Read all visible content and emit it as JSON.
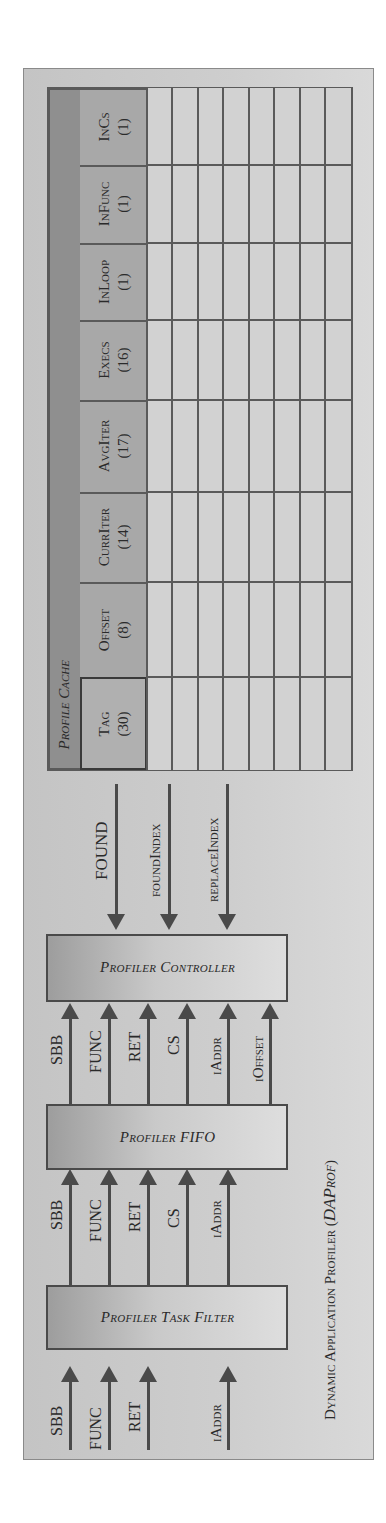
{
  "diagram": {
    "caption": "Dynamic Application Profiler (DAProf)",
    "caption_main": "Dynamic Application Profiler (",
    "caption_italic": "DAProf",
    "caption_close": ")",
    "blocks": {
      "task_filter": "Profiler Task Filter",
      "fifo": "Profiler FIFO",
      "controller": "Profiler Controller"
    },
    "inputs_to_task_filter": [
      "SBB",
      "FUNC",
      "RET",
      "iAddr"
    ],
    "task_filter_to_fifo": [
      "SBB",
      "FUNC",
      "RET",
      "CS",
      "iAddr"
    ],
    "fifo_to_controller": [
      "SBB",
      "FUNC",
      "RET",
      "CS",
      "iAddr",
      "iOffset"
    ],
    "cache_to_controller": [
      "FOUND",
      "foundIndex",
      "replaceIndex"
    ],
    "profile_cache": {
      "title": "Profile Cache",
      "columns": [
        {
          "name": "Tag",
          "bits": "(30)"
        },
        {
          "name": "Offset",
          "bits": "(8)"
        },
        {
          "name": "CurrIter",
          "bits": "(14)"
        },
        {
          "name": "AvgIter",
          "bits": "(17)"
        },
        {
          "name": "Execs",
          "bits": "(16)"
        },
        {
          "name": "InLoop",
          "bits": "(1)"
        },
        {
          "name": "InFunc",
          "bits": "(1)"
        },
        {
          "name": "InCs",
          "bits": "(1)"
        }
      ],
      "rows": 8
    }
  },
  "colors": {
    "frame_bg": "#cecece",
    "stroke": "#4a4a4a",
    "cache_title_bg": "#8f8f8f",
    "header_bg": "#a8a8a8",
    "cell_bg": "#d4d4d4"
  }
}
